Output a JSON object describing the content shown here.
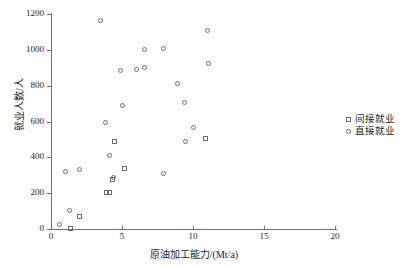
{
  "chart_data": {
    "type": "scatter",
    "title": "",
    "xlabel": "原油加工能力/(Mt/a)",
    "ylabel": "就业人数/人",
    "xlim": [
      0,
      20
    ],
    "ylim": [
      0,
      1200
    ],
    "xticks": [
      0,
      5,
      10,
      15,
      20
    ],
    "yticks": [
      0,
      200,
      400,
      600,
      800,
      1000,
      1200
    ],
    "grid": false,
    "legend_position": "right",
    "series": [
      {
        "name": "间接就业",
        "marker": "square",
        "color": "#6b6b6b",
        "points": [
          [
            1.4,
            5
          ],
          [
            2.0,
            67
          ],
          [
            3.9,
            203
          ],
          [
            4.1,
            203
          ],
          [
            4.3,
            277
          ],
          [
            4.5,
            490
          ],
          [
            5.15,
            340
          ],
          [
            10.9,
            505
          ]
        ]
      },
      {
        "name": "直接就业",
        "marker": "circle",
        "color": "#6b6b6b",
        "points": [
          [
            0.6,
            25
          ],
          [
            1.0,
            320
          ],
          [
            1.3,
            102
          ],
          [
            2.0,
            330
          ],
          [
            3.5,
            1165
          ],
          [
            3.85,
            592
          ],
          [
            4.1,
            410
          ],
          [
            4.4,
            285
          ],
          [
            4.9,
            882
          ],
          [
            5.0,
            692
          ],
          [
            6.0,
            892
          ],
          [
            6.55,
            1002
          ],
          [
            6.6,
            902
          ],
          [
            7.9,
            310
          ],
          [
            7.95,
            1007
          ],
          [
            8.9,
            810
          ],
          [
            9.4,
            705
          ],
          [
            9.5,
            487
          ],
          [
            10.0,
            565
          ],
          [
            11.0,
            1110
          ],
          [
            11.1,
            925
          ]
        ]
      }
    ]
  },
  "axes": {
    "x_tick_labels": [
      "0",
      "5",
      "10",
      "15",
      "20"
    ],
    "y_tick_labels": [
      "0",
      "200",
      "400",
      "600",
      "800",
      "1000",
      "1200"
    ],
    "x_title": "原油加工能力/(Mt/a)",
    "y_title": "就业人数/人"
  },
  "legend": {
    "items": [
      {
        "label": "间接就业",
        "marker": "square"
      },
      {
        "label": "直接就业",
        "marker": "circle"
      }
    ]
  }
}
